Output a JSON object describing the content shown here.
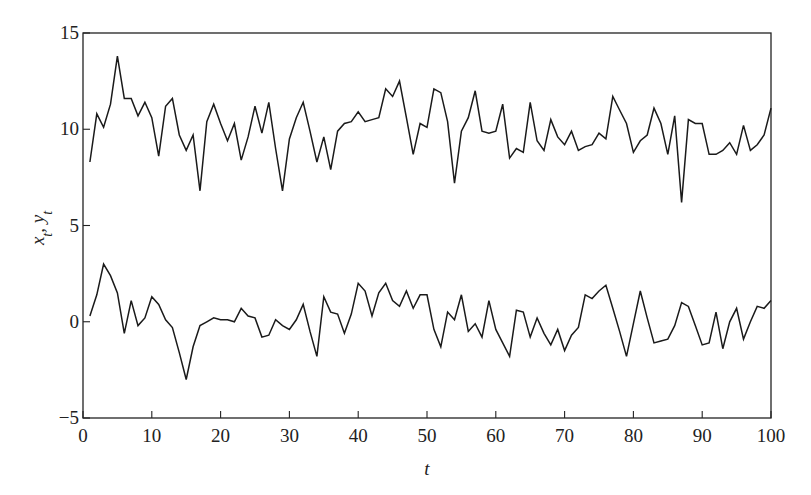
{
  "chart_data": {
    "type": "line",
    "title": "",
    "xlabel": "t",
    "ylabel": "x_t, y_t",
    "xlim": [
      0,
      100
    ],
    "ylim": [
      -5,
      15
    ],
    "xticks": [
      0,
      10,
      20,
      30,
      40,
      50,
      60,
      70,
      80,
      90,
      100
    ],
    "yticks": [
      -5,
      0,
      5,
      10,
      15
    ],
    "grid": false,
    "legend": null,
    "x": [
      1,
      2,
      3,
      4,
      5,
      6,
      7,
      8,
      9,
      10,
      11,
      12,
      13,
      14,
      15,
      16,
      17,
      18,
      19,
      20,
      21,
      22,
      23,
      24,
      25,
      26,
      27,
      28,
      29,
      30,
      31,
      32,
      33,
      34,
      35,
      36,
      37,
      38,
      39,
      40,
      41,
      42,
      43,
      44,
      45,
      46,
      47,
      48,
      49,
      50,
      51,
      52,
      53,
      54,
      55,
      56,
      57,
      58,
      59,
      60,
      61,
      62,
      63,
      64,
      65,
      66,
      67,
      68,
      69,
      70,
      71,
      72,
      73,
      74,
      75,
      76,
      77,
      78,
      79,
      80,
      81,
      82,
      83,
      84,
      85,
      86,
      87,
      88,
      89,
      90,
      91,
      92,
      93,
      94,
      95,
      96,
      97,
      98,
      99,
      100
    ],
    "series": [
      {
        "name": "x_t",
        "values": [
          8.3,
          10.8,
          10.1,
          11.3,
          13.8,
          11.6,
          11.6,
          10.7,
          11.4,
          10.6,
          8.6,
          11.2,
          11.6,
          9.7,
          8.9,
          9.7,
          6.8,
          10.4,
          11.3,
          10.3,
          9.4,
          10.3,
          8.4,
          9.6,
          11.2,
          9.8,
          11.4,
          9.0,
          6.8,
          9.5,
          10.6,
          11.4,
          9.9,
          8.3,
          9.6,
          7.9,
          9.9,
          10.3,
          10.4,
          10.9,
          10.4,
          10.5,
          10.6,
          12.1,
          11.7,
          12.5,
          10.6,
          8.7,
          10.3,
          10.1,
          12.1,
          11.9,
          10.4,
          7.2,
          9.9,
          10.6,
          12.0,
          9.9,
          9.8,
          9.9,
          11.3,
          8.5,
          9.0,
          8.8,
          11.4,
          9.4,
          8.9,
          10.5,
          9.6,
          9.2,
          9.9,
          8.9,
          9.1,
          9.2,
          9.8,
          9.5,
          11.7,
          11.0,
          10.3,
          8.8,
          9.4,
          9.7,
          11.1,
          10.3,
          8.7,
          10.7,
          6.2,
          10.5,
          10.3,
          10.3,
          8.7,
          8.7,
          8.9,
          9.3,
          8.7,
          10.2,
          8.9,
          9.2,
          9.7,
          11.1
        ]
      },
      {
        "name": "y_t",
        "values": [
          0.3,
          1.4,
          3.0,
          2.4,
          1.5,
          -0.6,
          1.1,
          -0.2,
          0.2,
          1.3,
          0.9,
          0.1,
          -0.3,
          -1.6,
          -3.0,
          -1.3,
          -0.2,
          0.0,
          0.2,
          0.1,
          0.1,
          0.0,
          0.7,
          0.3,
          0.2,
          -0.8,
          -0.7,
          0.1,
          -0.2,
          -0.4,
          0.1,
          0.9,
          -0.5,
          -1.8,
          1.3,
          0.5,
          0.4,
          -0.6,
          0.4,
          2.0,
          1.6,
          0.3,
          1.5,
          2.0,
          1.1,
          0.8,
          1.6,
          0.7,
          1.4,
          1.4,
          -0.4,
          -1.3,
          0.5,
          0.1,
          1.4,
          -0.5,
          -0.1,
          -0.8,
          1.1,
          -0.4,
          -1.1,
          -1.8,
          0.6,
          0.5,
          -0.8,
          0.2,
          -0.6,
          -1.2,
          -0.4,
          -1.5,
          -0.7,
          -0.3,
          1.4,
          1.2,
          1.6,
          1.9,
          0.7,
          -0.5,
          -1.8,
          -0.1,
          1.6,
          0.2,
          -1.1,
          -1.0,
          -0.9,
          -0.2,
          1.0,
          0.8,
          -0.2,
          -1.2,
          -1.1,
          0.5,
          -1.4,
          0.0,
          0.7,
          -0.9,
          0.0,
          0.8,
          0.7,
          1.1
        ]
      }
    ],
    "plot_area_px": {
      "left": 83,
      "right": 771,
      "top": 33,
      "bottom": 418
    },
    "line_color": "#1a1a1a"
  }
}
